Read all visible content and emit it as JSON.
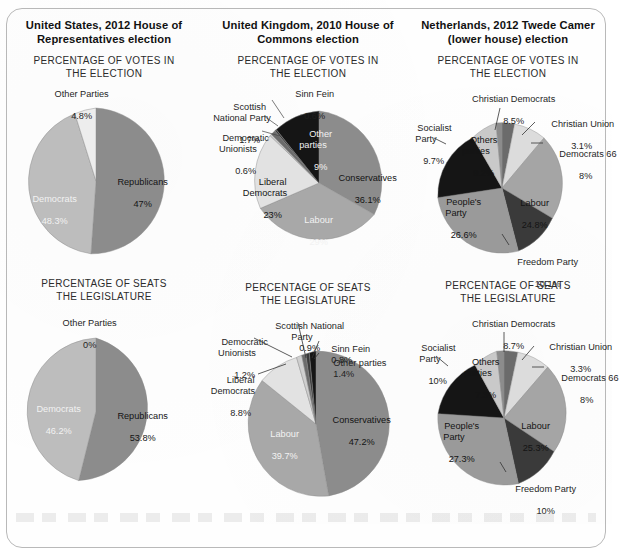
{
  "figure": {
    "columns": [
      {
        "id": "us",
        "country_title": "United States, 2012 House of\nRepresentatives election",
        "charts": [
          {
            "id": "us-votes",
            "section_title": "PERCENTAGE OF VOTES IN\nTHE ELECTION",
            "labels": [
              {
                "name": "Other Parties",
                "value": "4.8%"
              },
              {
                "name": "Republicans",
                "value": "47%"
              },
              {
                "name": "Democrats",
                "value": "48.3%"
              }
            ]
          },
          {
            "id": "us-seats",
            "section_title": "PERCENTAGE OF SEATS\nTHE LEGISLATURE",
            "labels": [
              {
                "name": "Other Parties",
                "value": "0%"
              },
              {
                "name": "Republicans",
                "value": "53.8%"
              },
              {
                "name": "Democrats",
                "value": "46.2%"
              }
            ]
          }
        ]
      },
      {
        "id": "uk",
        "country_title": "United Kingdom, 2010 House of\nCommons election",
        "charts": [
          {
            "id": "uk-votes",
            "section_title": "PERCENTAGE OF VOTES IN\nTHE ELECTION",
            "labels": [
              {
                "name": "Sinn Fein",
                "value": "0.6%"
              },
              {
                "name": "Scottish\nNational Party",
                "value": "1.7%"
              },
              {
                "name": "Democratic\nUnionists",
                "value": "0.6%"
              },
              {
                "name": "Other\nparties",
                "value": "9%"
              },
              {
                "name": "Conservatives",
                "value": "36.1%"
              },
              {
                "name": "Labour",
                "value": "29%"
              },
              {
                "name": "Liberal\nDemocrats",
                "value": "23%"
              }
            ]
          },
          {
            "id": "uk-seats",
            "section_title": "PERCENTAGE OF SEATS\nTHE LEGISLATURE",
            "labels": [
              {
                "name": "Scottish National\nParty",
                "value": "0.9%"
              },
              {
                "name": "Sinn Fein",
                "value": "0.8%"
              },
              {
                "name": "Other parties",
                "value": "1.4%"
              },
              {
                "name": "Democratic\nUnionists",
                "value": "1.2%"
              },
              {
                "name": "Liberal\nDemocrats",
                "value": "8.8%"
              },
              {
                "name": "Conservatives",
                "value": "47.2%"
              },
              {
                "name": "Labour",
                "value": "39.7%"
              }
            ]
          }
        ]
      },
      {
        "id": "nl",
        "country_title": "Netherlands, 2012 Twede Camer\n(lower house) election",
        "charts": [
          {
            "id": "nl-votes",
            "section_title": "PERCENTAGE OF VOTES IN\nTHE ELECTION",
            "labels": [
              {
                "name": "Christian Democrats",
                "value": "8.5%"
              },
              {
                "name": "Christian Union",
                "value": "3.1%"
              },
              {
                "name": "Democrats 66",
                "value": "8%"
              },
              {
                "name": "Labour",
                "value": "24.8%"
              },
              {
                "name": "Freedom Party",
                "value": "10.1%"
              },
              {
                "name": "People's\nParty",
                "value": "26.6%"
              },
              {
                "name": "Socialist\nParty",
                "value": "9.7%"
              },
              {
                "name": "Others\nparties",
                "value": "9.2%"
              }
            ]
          },
          {
            "id": "nl-seats",
            "section_title": "PERCENTAGE OF SEATS\nTHE LEGISLATURE",
            "labels": [
              {
                "name": "Christian Democrats",
                "value": "8.7%"
              },
              {
                "name": "Christian Union",
                "value": "3.3%"
              },
              {
                "name": "Democrats 66",
                "value": "8%"
              },
              {
                "name": "Labour",
                "value": "25.3%"
              },
              {
                "name": "Freedom Party",
                "value": "10%"
              },
              {
                "name": "People's\nParty",
                "value": "27.3%"
              },
              {
                "name": "Socialist\nParty",
                "value": "10%"
              },
              {
                "name": "Others\nparties",
                "value": "7.3%"
              }
            ]
          }
        ]
      }
    ]
  },
  "palette": {
    "mid_gray": "#8c8c8c",
    "light_gray": "#d9d9d9",
    "pale_gray": "#ededed",
    "dark_gray": "#6b6b6b",
    "very_dark": "#3a3a3a",
    "near_black": "#151515",
    "soft_gray": "#bdbdbd",
    "outline": "#8a8a8a"
  },
  "chart_data": [
    {
      "type": "pie",
      "id": "us-votes",
      "title": "PERCENTAGE OF VOTES IN THE ELECTION",
      "country": "United States, 2012 House of Representatives election",
      "categories": [
        "Republicans",
        "Democrats",
        "Other Parties"
      ],
      "values": [
        47,
        48.3,
        4.8
      ],
      "units": "percent",
      "colors": [
        "#8c8c8c",
        "#bdbdbd",
        "#ededed"
      ],
      "start_angle_deg": 0,
      "direction": "clockwise",
      "legend": "labels-on-slices"
    },
    {
      "type": "pie",
      "id": "us-seats",
      "title": "PERCENTAGE OF SEATS THE LEGISLATURE",
      "country": "United States, 2012 House of Representatives election",
      "categories": [
        "Republicans",
        "Democrats",
        "Other Parties"
      ],
      "values": [
        53.8,
        46.2,
        0
      ],
      "units": "percent",
      "colors": [
        "#8c8c8c",
        "#bdbdbd",
        "#ededed"
      ],
      "start_angle_deg": 0,
      "direction": "clockwise",
      "legend": "labels-on-slices"
    },
    {
      "type": "pie",
      "id": "uk-votes",
      "title": "PERCENTAGE OF VOTES IN THE ELECTION",
      "country": "United Kingdom, 2010 House of Commons election",
      "categories": [
        "Conservatives",
        "Labour",
        "Liberal Democrats",
        "Democratic Unionists",
        "Scottish National Party",
        "Sinn Fein",
        "Other parties"
      ],
      "values": [
        36.1,
        29,
        23,
        0.6,
        1.7,
        0.6,
        9
      ],
      "units": "percent",
      "colors": [
        "#8c8c8c",
        "#a8a8a8",
        "#e2e2e2",
        "#cfcfcf",
        "#6b6b6b",
        "#3a3a3a",
        "#151515"
      ],
      "start_angle_deg": 0,
      "direction": "clockwise",
      "legend": "labels-on-slices-and-leaders"
    },
    {
      "type": "pie",
      "id": "uk-seats",
      "title": "PERCENTAGE OF SEATS THE LEGISLATURE",
      "country": "United Kingdom, 2010 House of Commons election",
      "categories": [
        "Conservatives",
        "Labour",
        "Liberal Democrats",
        "Democratic Unionists",
        "Scottish National Party",
        "Sinn Fein",
        "Other parties"
      ],
      "values": [
        47.2,
        39.7,
        8.8,
        1.2,
        0.9,
        0.8,
        1.4
      ],
      "units": "percent",
      "colors": [
        "#8c8c8c",
        "#a8a8a8",
        "#e2e2e2",
        "#cfcfcf",
        "#6b6b6b",
        "#3a3a3a",
        "#151515"
      ],
      "start_angle_deg": 0,
      "direction": "clockwise",
      "legend": "labels-on-slices-and-leaders"
    },
    {
      "type": "pie",
      "id": "nl-votes",
      "title": "PERCENTAGE OF VOTES IN THE ELECTION",
      "country": "Netherlands, 2012 Twede Camer (lower house) election",
      "categories": [
        "Christian Union",
        "Democrats 66",
        "Labour",
        "Freedom Party",
        "People's Party",
        "Socialist Party",
        "Others parties",
        "Christian Democrats"
      ],
      "values": [
        3.1,
        8,
        24.8,
        10.1,
        26.6,
        9.7,
        9.2,
        8.5
      ],
      "units": "percent",
      "colors": [
        "#6b6b6b",
        "#dcdcdc",
        "#a5a5a5",
        "#3a3a3a",
        "#9a9a9a",
        "#151515",
        "#c9c9c9",
        "#8c8c8c"
      ],
      "start_angle_deg": 0,
      "direction": "clockwise",
      "legend": "labels-on-slices-and-leaders"
    },
    {
      "type": "pie",
      "id": "nl-seats",
      "title": "PERCENTAGE OF SEATS THE LEGISLATURE",
      "country": "Netherlands, 2012 Twede Camer (lower house) election",
      "categories": [
        "Christian Union",
        "Democrats 66",
        "Labour",
        "Freedom Party",
        "People's Party",
        "Socialist Party",
        "Others parties",
        "Christian Democrats"
      ],
      "values": [
        3.3,
        8,
        25.3,
        10,
        27.3,
        10,
        7.3,
        8.7
      ],
      "units": "percent",
      "colors": [
        "#6b6b6b",
        "#dcdcdc",
        "#a5a5a5",
        "#3a3a3a",
        "#9a9a9a",
        "#151515",
        "#c9c9c9",
        "#8c8c8c"
      ],
      "start_angle_deg": 0,
      "direction": "clockwise",
      "legend": "labels-on-slices-and-leaders"
    }
  ]
}
